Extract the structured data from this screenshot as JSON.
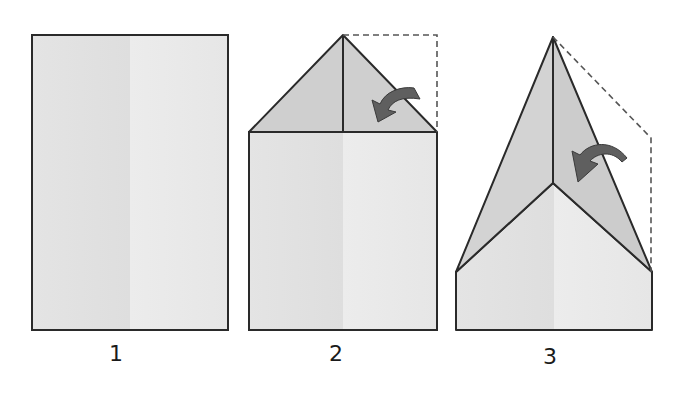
{
  "diagram": {
    "type": "paper-airplane-folding-steps",
    "colors": {
      "paper": "#e6e6e6",
      "paper_light": "#ececec",
      "folded_flap": "#cfcfcf",
      "outline": "#2a2a2a",
      "arrow": "#5f5f5f",
      "dashed": "#555555"
    },
    "steps": [
      {
        "label": "1",
        "description": "Rectangular sheet of paper"
      },
      {
        "label": "2",
        "description": "Fold top corners down to center crease"
      },
      {
        "label": "3",
        "description": "Fold slanted edges to center again"
      }
    ]
  }
}
